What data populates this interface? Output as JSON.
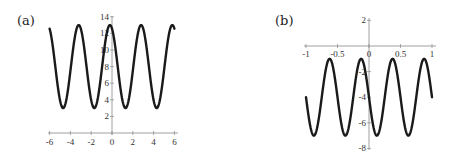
{
  "chart_data": [
    {
      "type": "line",
      "panel_label": "(a)",
      "title": "",
      "xlabel": "",
      "ylabel": "",
      "xlim": [
        -6,
        6
      ],
      "ylim": [
        0,
        14
      ],
      "x_ticks": [
        -6,
        -4,
        -2,
        0,
        2,
        4,
        6
      ],
      "x_tick_labels": [
        "-6",
        "-4",
        "-2",
        "0",
        "2",
        "4",
        "6"
      ],
      "y_ticks": [
        2,
        4,
        6,
        8,
        10,
        12,
        14
      ],
      "y_tick_labels": [
        "2",
        "4",
        "6",
        "8",
        "10",
        "12",
        "14"
      ],
      "grid": false,
      "series": [
        {
          "name": "curve-a",
          "description": "sinusoid oscillating between ~3 and ~13, period ~3",
          "function": {
            "kind": "cos",
            "offset": 8,
            "amplitude": 5,
            "period": 3.0,
            "phase_shift": -0.2
          },
          "x": [
            -6,
            -4.7,
            -3.2,
            -1.7,
            -0.2,
            1.3,
            2.8,
            4.3,
            5.9,
            6
          ],
          "y": [
            12.6,
            3,
            13,
            3,
            13,
            3,
            13,
            3,
            13,
            12.6
          ]
        }
      ]
    },
    {
      "type": "line",
      "panel_label": "(b)",
      "title": "",
      "xlabel": "",
      "ylabel": "",
      "xlim": [
        -1,
        1
      ],
      "ylim": [
        -8,
        2
      ],
      "x_ticks": [
        -1,
        -0.5,
        0,
        0.5,
        1
      ],
      "x_tick_labels": [
        "-1",
        "-0.5",
        "0",
        "0.5",
        "1"
      ],
      "y_ticks": [
        2,
        -2,
        -4,
        -6,
        -8
      ],
      "y_tick_labels": [
        "2",
        "-2",
        "-4",
        "-6",
        "-8"
      ],
      "grid": false,
      "series": [
        {
          "name": "curve-b",
          "description": "sinusoid oscillating between ~-1 and ~-7, period ~0.5",
          "function": {
            "kind": "neg-sin",
            "offset": -4,
            "amplitude": 3,
            "period": 0.5,
            "phase_shift": 0
          },
          "x": [
            -1,
            -0.875,
            -0.625,
            -0.375,
            -0.125,
            0.125,
            0.375,
            0.625,
            0.875,
            1
          ],
          "y": [
            -4,
            -7,
            -1,
            -7,
            -1,
            -7,
            -1,
            -7,
            -1,
            -4
          ]
        }
      ]
    }
  ]
}
